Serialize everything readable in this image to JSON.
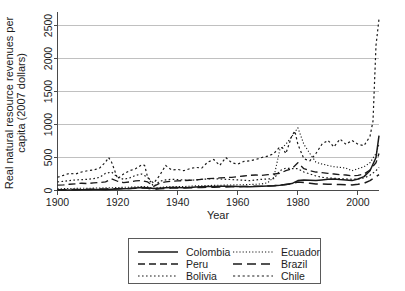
{
  "chart_data": {
    "type": "line",
    "title": "",
    "xlabel": "Year",
    "ylabel": "Real natural resource revenues per capita (2007 dollars)",
    "xlim": [
      1900,
      2007
    ],
    "ylim": [
      0,
      2700
    ],
    "xticks": [
      1900,
      1920,
      1940,
      1960,
      1980,
      2000
    ],
    "xticklabels": [
      "1900",
      "1920",
      "1940",
      "1960",
      "1980",
      "2000"
    ],
    "yticks": [
      0,
      500,
      1000,
      1500,
      2000,
      2500
    ],
    "yticklabels": [
      "0",
      "500",
      "1000",
      "1500",
      "2000",
      "2500"
    ],
    "grid": "horizontal",
    "legend_position": "below-center",
    "legend_columns": 2,
    "series": [
      {
        "name": "Colombia",
        "style": "solid",
        "dash": "none",
        "width": 1.5,
        "x": [
          1900,
          1902,
          1904,
          1906,
          1908,
          1910,
          1912,
          1914,
          1916,
          1918,
          1920,
          1922,
          1924,
          1926,
          1928,
          1930,
          1932,
          1934,
          1936,
          1938,
          1940,
          1942,
          1944,
          1946,
          1948,
          1950,
          1952,
          1954,
          1956,
          1958,
          1960,
          1962,
          1964,
          1966,
          1968,
          1970,
          1972,
          1974,
          1976,
          1978,
          1980,
          1982,
          1984,
          1986,
          1988,
          1990,
          1992,
          1994,
          1996,
          1998,
          2000,
          2002,
          2004,
          2006,
          2007
        ],
        "y": [
          6,
          7,
          8,
          9,
          10,
          12,
          14,
          15,
          13,
          18,
          22,
          26,
          30,
          38,
          44,
          40,
          30,
          35,
          42,
          45,
          44,
          40,
          45,
          52,
          58,
          60,
          62,
          64,
          66,
          64,
          62,
          60,
          58,
          60,
          64,
          70,
          72,
          80,
          92,
          105,
          150,
          160,
          155,
          150,
          160,
          170,
          175,
          165,
          160,
          150,
          175,
          210,
          300,
          500,
          830
        ]
      },
      {
        "name": "Peru",
        "style": "dashed",
        "dash": "7,4",
        "width": 1.3,
        "x": [
          1900,
          1902,
          1904,
          1906,
          1908,
          1910,
          1912,
          1914,
          1916,
          1918,
          1920,
          1922,
          1924,
          1926,
          1928,
          1930,
          1932,
          1934,
          1936,
          1938,
          1940,
          1942,
          1944,
          1946,
          1948,
          1950,
          1952,
          1954,
          1956,
          1958,
          1960,
          1962,
          1964,
          1966,
          1968,
          1970,
          1972,
          1974,
          1976,
          1978,
          1980,
          1982,
          1984,
          1986,
          1988,
          1990,
          1992,
          1994,
          1996,
          1998,
          2000,
          2002,
          2004,
          2006,
          2007
        ],
        "y": [
          80,
          85,
          95,
          100,
          110,
          105,
          115,
          120,
          130,
          175,
          140,
          120,
          130,
          145,
          150,
          130,
          60,
          110,
          130,
          140,
          145,
          150,
          155,
          160,
          170,
          180,
          185,
          190,
          195,
          200,
          210,
          220,
          230,
          235,
          230,
          240,
          250,
          260,
          300,
          330,
          420,
          330,
          300,
          280,
          270,
          260,
          250,
          240,
          235,
          220,
          230,
          250,
          310,
          420,
          560
        ]
      },
      {
        "name": "Bolivia",
        "style": "dotted",
        "dash": "1.6,2.4",
        "width": 1.2,
        "x": [
          1900,
          1902,
          1904,
          1906,
          1908,
          1910,
          1912,
          1914,
          1916,
          1918,
          1920,
          1922,
          1924,
          1926,
          1928,
          1930,
          1932,
          1934,
          1936,
          1938,
          1940,
          1942,
          1944,
          1946,
          1948,
          1950,
          1952,
          1954,
          1956,
          1958,
          1960,
          1962,
          1964,
          1966,
          1968,
          1970,
          1972,
          1974,
          1976,
          1978,
          1980,
          1982,
          1984,
          1986,
          1988,
          1990,
          1992,
          1994,
          1996,
          1998,
          2000,
          2002,
          2004,
          2006,
          2007
        ],
        "y": [
          130,
          140,
          150,
          160,
          165,
          170,
          180,
          200,
          260,
          280,
          200,
          170,
          190,
          230,
          250,
          200,
          60,
          140,
          160,
          170,
          165,
          160,
          155,
          160,
          170,
          175,
          180,
          175,
          170,
          165,
          160,
          155,
          150,
          160,
          170,
          175,
          180,
          300,
          340,
          330,
          330,
          280,
          250,
          220,
          200,
          190,
          185,
          180,
          175,
          170,
          175,
          190,
          230,
          300,
          350
        ]
      },
      {
        "name": "Ecuador",
        "style": "fine-dotted",
        "dash": "1.2,2.0",
        "width": 1.1,
        "x": [
          1900,
          1902,
          1904,
          1906,
          1908,
          1910,
          1912,
          1914,
          1916,
          1918,
          1920,
          1922,
          1924,
          1926,
          1928,
          1930,
          1932,
          1934,
          1936,
          1938,
          1940,
          1942,
          1944,
          1946,
          1948,
          1950,
          1952,
          1954,
          1956,
          1958,
          1960,
          1962,
          1964,
          1966,
          1968,
          1970,
          1972,
          1974,
          1976,
          1978,
          1980,
          1982,
          1984,
          1986,
          1988,
          1990,
          1992,
          1994,
          1996,
          1998,
          2000,
          2002,
          2004,
          2006,
          2007
        ],
        "y": [
          25,
          28,
          30,
          32,
          35,
          34,
          36,
          38,
          40,
          42,
          45,
          48,
          50,
          55,
          60,
          55,
          35,
          45,
          55,
          60,
          62,
          60,
          65,
          70,
          72,
          75,
          78,
          80,
          82,
          84,
          86,
          88,
          90,
          95,
          100,
          120,
          200,
          620,
          700,
          820,
          950,
          700,
          560,
          430,
          400,
          380,
          360,
          350,
          340,
          300,
          330,
          360,
          420,
          560,
          700
        ]
      },
      {
        "name": "Brazil",
        "style": "long-dashed",
        "dash": "9,5",
        "width": 1.5,
        "x": [
          1900,
          1902,
          1904,
          1906,
          1908,
          1910,
          1912,
          1914,
          1916,
          1918,
          1920,
          1922,
          1924,
          1926,
          1928,
          1930,
          1932,
          1934,
          1936,
          1938,
          1940,
          1942,
          1944,
          1946,
          1948,
          1950,
          1952,
          1954,
          1956,
          1958,
          1960,
          1962,
          1964,
          1966,
          1968,
          1970,
          1972,
          1974,
          1976,
          1978,
          1980,
          1982,
          1984,
          1986,
          1988,
          1990,
          1992,
          1994,
          1996,
          1998,
          2000,
          2002,
          2004,
          2006,
          2007
        ],
        "y": [
          12,
          13,
          14,
          15,
          16,
          18,
          20,
          22,
          24,
          26,
          28,
          30,
          32,
          34,
          36,
          34,
          18,
          26,
          32,
          36,
          38,
          36,
          40,
          44,
          46,
          48,
          50,
          52,
          54,
          56,
          58,
          60,
          62,
          64,
          66,
          70,
          72,
          80,
          90,
          100,
          130,
          120,
          110,
          100,
          98,
          95,
          92,
          90,
          88,
          85,
          95,
          110,
          150,
          210,
          240
        ]
      },
      {
        "name": "Chile",
        "style": "spaced-dotted",
        "dash": "2.2,2.6",
        "width": 1.2,
        "x": [
          1900,
          1902,
          1904,
          1906,
          1908,
          1910,
          1912,
          1914,
          1916,
          1917,
          1918,
          1920,
          1922,
          1924,
          1926,
          1928,
          1929,
          1930,
          1932,
          1934,
          1936,
          1938,
          1940,
          1942,
          1944,
          1946,
          1948,
          1950,
          1952,
          1954,
          1956,
          1958,
          1960,
          1962,
          1964,
          1966,
          1968,
          1970,
          1972,
          1974,
          1975,
          1976,
          1978,
          1979,
          1980,
          1982,
          1984,
          1986,
          1988,
          1990,
          1992,
          1994,
          1996,
          1998,
          2000,
          2002,
          2004,
          2005,
          2006,
          2007
        ],
        "y": [
          200,
          230,
          260,
          250,
          280,
          300,
          310,
          340,
          430,
          500,
          430,
          180,
          250,
          300,
          330,
          390,
          380,
          200,
          110,
          230,
          380,
          310,
          320,
          300,
          330,
          350,
          340,
          430,
          470,
          380,
          500,
          420,
          400,
          440,
          450,
          470,
          500,
          520,
          560,
          660,
          640,
          560,
          830,
          900,
          700,
          480,
          450,
          560,
          700,
          760,
          660,
          780,
          700,
          760,
          700,
          680,
          820,
          1050,
          2200,
          2600
        ]
      }
    ]
  },
  "legend": {
    "entries": [
      {
        "label": "Colombia"
      },
      {
        "label": "Peru"
      },
      {
        "label": "Bolivia"
      },
      {
        "label": "Ecuador"
      },
      {
        "label": "Brazil"
      },
      {
        "label": "Chile"
      }
    ]
  },
  "axis_labels": {
    "x": "Year",
    "y_line1": "Real natural resource revenues per",
    "y_line2": "capita (2007 dollars)"
  }
}
